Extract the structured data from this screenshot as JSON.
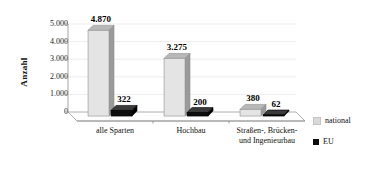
{
  "chart_data": {
    "type": "bar",
    "title": "",
    "subtitle": "",
    "xlabel": "",
    "ylabel": "Anzahl",
    "ylim": [
      0,
      5000
    ],
    "yticks": [
      0,
      1000,
      2000,
      3000,
      4000,
      5000
    ],
    "ytick_labels": [
      "0",
      "1.000",
      "2.000",
      "3.000",
      "4.000",
      "5.000"
    ],
    "categories": [
      "alle Sparten",
      "Hochbau",
      "Straßen-, Brücken- und Ingenieurbau"
    ],
    "category_lines": [
      [
        "alle Sparten"
      ],
      [
        "Hochbau"
      ],
      [
        "Straßen-, Brücken-",
        "und Ingenieurbau"
      ]
    ],
    "series": [
      {
        "name": "national",
        "color": "#e2e2e2",
        "values": [
          4870,
          3275,
          380
        ],
        "labels": [
          "4.870",
          "3.275",
          "380"
        ]
      },
      {
        "name": "EU",
        "color": "#0d0d0d",
        "values": [
          322,
          200,
          62
        ],
        "labels": [
          "322",
          "200",
          "62"
        ]
      }
    ],
    "grid": true,
    "grid_axis": "y",
    "legend_position": "right-bottom",
    "three_d": true
  },
  "legend": {
    "items": [
      {
        "label": "national",
        "color": "#d9d9d9"
      },
      {
        "label": "EU",
        "color": "#0d0d0d"
      }
    ]
  },
  "colors": {
    "background": "#ffffff",
    "axis": "#8d8d8d",
    "grid": "#e9e9e9",
    "floor": "#fdfdfd",
    "national_front": "#e4e4e4",
    "national_side": "#9a9a9a",
    "national_top": "#b8b8b8",
    "eu_front": "#0d0d0d",
    "eu_side": "#000000",
    "eu_top": "#3a3a3a",
    "text": "#111111"
  }
}
